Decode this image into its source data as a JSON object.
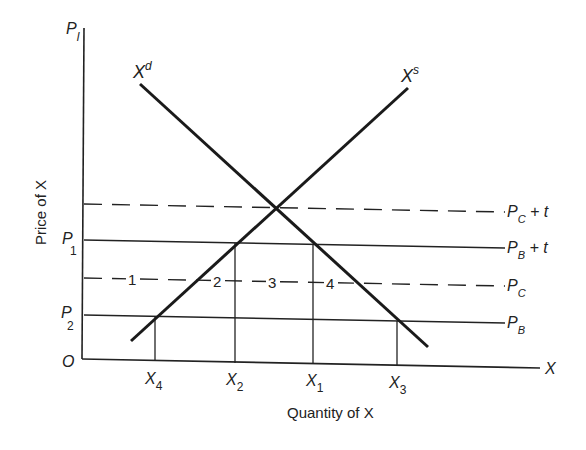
{
  "diagram": {
    "type": "supply-demand",
    "y_axis": {
      "label": "Price of X",
      "top_label": "P",
      "top_label_sub": "l",
      "origin": "O"
    },
    "x_axis": {
      "label": "Quantity of X",
      "end_label": "X"
    },
    "curves": {
      "demand": {
        "label": "X",
        "sup": "d"
      },
      "supply": {
        "label": "X",
        "sup": "s"
      }
    },
    "price_lines": [
      {
        "id": "pc_plus_t",
        "style": "dashed",
        "right_label": "P",
        "right_sub": "C",
        "right_suffix": " + t",
        "left_label": "",
        "left_sub": ""
      },
      {
        "id": "pb_plus_t",
        "style": "solid",
        "right_label": "P",
        "right_sub": "B",
        "right_suffix": " + t",
        "left_label": "P",
        "left_sub": "1"
      },
      {
        "id": "pc",
        "style": "dashed",
        "right_label": "P",
        "right_sub": "C",
        "right_suffix": "",
        "left_label": "",
        "left_sub": ""
      },
      {
        "id": "pb",
        "style": "solid",
        "right_label": "P",
        "right_sub": "B",
        "right_suffix": "",
        "left_label": "P",
        "left_sub": "2"
      }
    ],
    "region_labels": [
      "1",
      "2",
      "3",
      "4"
    ],
    "quantity_ticks": [
      {
        "label": "X",
        "sub": "4"
      },
      {
        "label": "X",
        "sub": "2"
      },
      {
        "label": "X",
        "sub": "1"
      },
      {
        "label": "X",
        "sub": "3"
      }
    ],
    "colors": {
      "ink": "#222222",
      "background": "#ffffff"
    }
  }
}
